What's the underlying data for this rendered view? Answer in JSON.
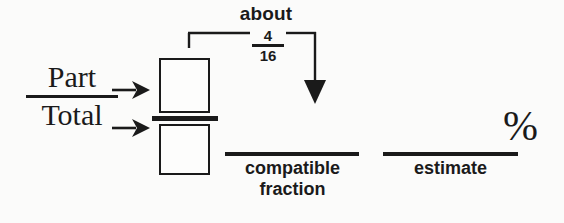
{
  "diagram": {
    "title_text": "about",
    "ratio": {
      "numerator_label": "Part",
      "denominator_label": "Total"
    },
    "compatible_fraction_callout": {
      "numerator": "4",
      "denominator": "16"
    },
    "blanks": [
      {
        "id": "compatible-fraction",
        "caption_line1": "compatible",
        "caption_line2": "fraction",
        "value": ""
      },
      {
        "id": "estimate",
        "caption_line1": "estimate",
        "caption_line2": "",
        "value": ""
      }
    ],
    "percent_symbol": "%",
    "arrow_numerator": "→",
    "arrow_denominator": "→",
    "colors": {
      "ink": "#1a1a1a",
      "paper": "#fbfbfa"
    }
  }
}
